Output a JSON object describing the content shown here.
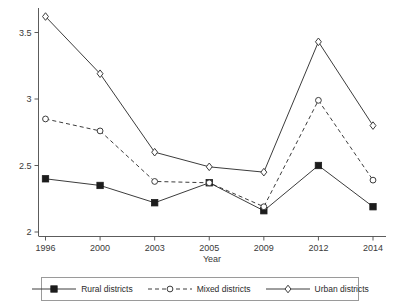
{
  "chart_data": {
    "type": "line",
    "title": "",
    "xlabel": "Year",
    "ylabel": "",
    "categories": [
      "1996",
      "2000",
      "2003",
      "2005",
      "2009",
      "2012",
      "2014"
    ],
    "ylim": [
      2,
      3.75
    ],
    "yticks": [
      "2",
      "2.5",
      "3",
      "3.5"
    ],
    "ytick_values": [
      2,
      2.5,
      3,
      3.5
    ],
    "grid": false,
    "legend_position": "below-plot",
    "series": [
      {
        "name": "Rural districts",
        "marker": "filled-square",
        "line": "solid",
        "color": "#3c3c3c",
        "values": [
          2.4,
          2.35,
          2.22,
          2.37,
          2.16,
          2.5,
          2.19
        ]
      },
      {
        "name": "Mixed districts",
        "marker": "open-circle",
        "line": "dashed",
        "color": "#3c3c3c",
        "values": [
          2.85,
          2.76,
          2.38,
          2.37,
          2.19,
          2.99,
          2.39
        ]
      },
      {
        "name": "Urban districts",
        "marker": "open-diamond",
        "line": "solid",
        "color": "#3c3c3c",
        "values": [
          3.62,
          3.19,
          2.6,
          2.49,
          2.45,
          3.43,
          2.8
        ]
      }
    ]
  },
  "legend": {
    "items": [
      {
        "label": "Rural districts",
        "marker": "filled-square",
        "line": "solid"
      },
      {
        "label": "Mixed districts",
        "marker": "open-circle",
        "line": "dashed"
      },
      {
        "label": "Urban districts",
        "marker": "open-diamond",
        "line": "solid"
      }
    ]
  },
  "axes": {
    "x_title": "Year",
    "x_tick_labels": [
      "1996",
      "2000",
      "2003",
      "2005",
      "2009",
      "2012",
      "2014"
    ],
    "y_tick_labels": [
      "2",
      "2.5",
      "3",
      "3.5"
    ]
  }
}
